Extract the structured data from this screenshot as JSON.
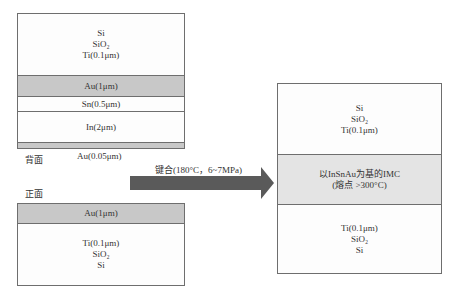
{
  "left_top_stack": {
    "layers": [
      {
        "lines": [
          "Si",
          "SiO₂",
          "Ti(0.1μm)"
        ]
      },
      {
        "label": "Au(1μm)"
      },
      {
        "label": "Sn(0.5μm)"
      },
      {
        "label": "In(2μm)"
      },
      {
        "label": ""
      }
    ],
    "side_label": "背面",
    "bottom_label": "Au(0.05μm)"
  },
  "left_bottom_stack": {
    "side_label": "正面",
    "layers": [
      {
        "label": "Au(1μm)"
      },
      {
        "lines": [
          "Ti(0.1μm)",
          "SiO₂",
          "Si"
        ]
      }
    ]
  },
  "arrow": {
    "label": "键合(180°C，6~7MPa)",
    "color": "#5a5a5a"
  },
  "right_stack": {
    "layers": [
      {
        "lines": [
          "Si",
          "SiO₂",
          "Ti(0.1μm)"
        ]
      },
      {
        "lines": [
          "以InSnAu为基的IMC",
          "(熔点 >300°C)"
        ]
      },
      {
        "lines": [
          "Ti(0.1μm)",
          "SiO₂",
          "Si"
        ]
      }
    ]
  },
  "colors": {
    "au_layer": "#c8c8c8",
    "imc_layer": "#e4e4e4",
    "border": "#6e6e6e"
  }
}
